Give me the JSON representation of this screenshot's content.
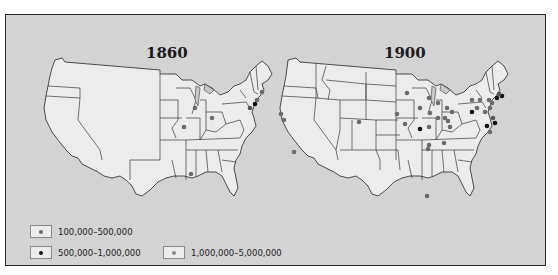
{
  "maps": [
    {
      "title": "1860",
      "cities": [
        {
          "x": 195,
          "y": 108,
          "class": "small"
        },
        {
          "x": 184,
          "y": 127,
          "class": "small"
        },
        {
          "x": 212,
          "y": 118,
          "class": "small"
        },
        {
          "x": 191,
          "y": 174,
          "class": "small"
        },
        {
          "x": 250,
          "y": 108,
          "class": "large"
        },
        {
          "x": 255,
          "y": 104,
          "class": "mid"
        },
        {
          "x": 257,
          "y": 100,
          "class": "small"
        },
        {
          "x": 262,
          "y": 92,
          "class": "small"
        }
      ]
    },
    {
      "title": "1900",
      "cities": [
        {
          "x": 281,
          "y": 114,
          "class": "small"
        },
        {
          "x": 284,
          "y": 120,
          "class": "small"
        },
        {
          "x": 294,
          "y": 152,
          "class": "small"
        },
        {
          "x": 359,
          "y": 122,
          "class": "small"
        },
        {
          "x": 397,
          "y": 114,
          "class": "small"
        },
        {
          "x": 405,
          "y": 124,
          "class": "small"
        },
        {
          "x": 407,
          "y": 93,
          "class": "small"
        },
        {
          "x": 420,
          "y": 108,
          "class": "small"
        },
        {
          "x": 429,
          "y": 98,
          "class": "small"
        },
        {
          "x": 420,
          "y": 129,
          "class": "mid"
        },
        {
          "x": 430,
          "y": 113,
          "class": "small"
        },
        {
          "x": 438,
          "y": 103,
          "class": "small"
        },
        {
          "x": 438,
          "y": 118,
          "class": "small"
        },
        {
          "x": 429,
          "y": 127,
          "class": "small"
        },
        {
          "x": 445,
          "y": 118,
          "class": "small"
        },
        {
          "x": 447,
          "y": 108,
          "class": "small"
        },
        {
          "x": 448,
          "y": 121,
          "class": "small"
        },
        {
          "x": 452,
          "y": 112,
          "class": "small"
        },
        {
          "x": 450,
          "y": 127,
          "class": "small"
        },
        {
          "x": 444,
          "y": 143,
          "class": "small"
        },
        {
          "x": 429,
          "y": 145,
          "class": "small"
        },
        {
          "x": 472,
          "y": 100,
          "class": "small"
        },
        {
          "x": 480,
          "y": 100,
          "class": "small"
        },
        {
          "x": 477,
          "y": 108,
          "class": "small"
        },
        {
          "x": 489,
          "y": 100,
          "class": "small"
        },
        {
          "x": 472,
          "y": 112,
          "class": "mid"
        },
        {
          "x": 485,
          "y": 112,
          "class": "small"
        },
        {
          "x": 490,
          "y": 108,
          "class": "small"
        },
        {
          "x": 492,
          "y": 103,
          "class": "small"
        },
        {
          "x": 497,
          "y": 98,
          "class": "mid"
        },
        {
          "x": 502,
          "y": 96,
          "class": "mid"
        },
        {
          "x": 499,
          "y": 94,
          "class": "large"
        },
        {
          "x": 493,
          "y": 118,
          "class": "large"
        },
        {
          "x": 495,
          "y": 123,
          "class": "mid"
        },
        {
          "x": 487,
          "y": 126,
          "class": "mid"
        },
        {
          "x": 490,
          "y": 132,
          "class": "small"
        },
        {
          "x": 427,
          "y": 196,
          "class": "small"
        },
        {
          "x": 428,
          "y": 149,
          "class": "small"
        }
      ]
    }
  ],
  "legend": [
    {
      "label": "100,000–500,000",
      "dot_color": "#6b6b6b"
    },
    {
      "label": "500,000–1,000,000",
      "dot_color": "#111111"
    },
    {
      "label": "1,000,000–5,000,000",
      "dot_color": "#8a8a8a"
    }
  ],
  "colors": {
    "background": "#d3d3d3",
    "land": "#ececec",
    "border": "#3a3a3a",
    "small_city": "#6b6b6b",
    "mid_city": "#111111",
    "large_city": "#555555"
  }
}
